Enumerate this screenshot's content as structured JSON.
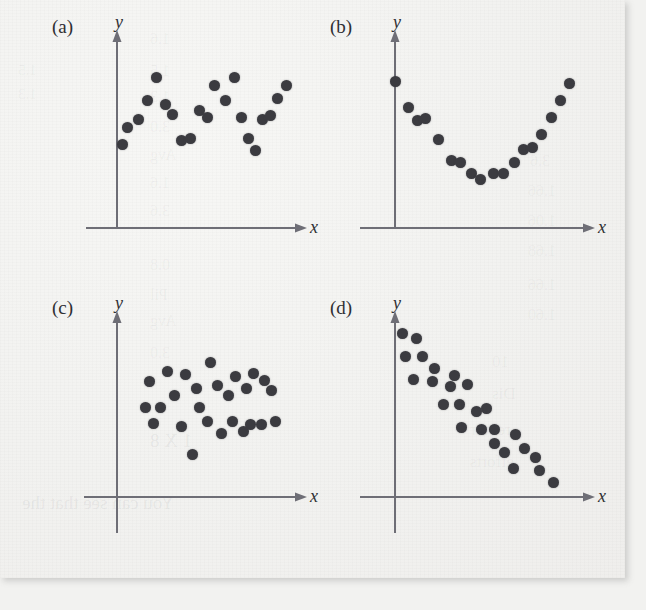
{
  "figure": {
    "background_color": "#f2f2f0",
    "dot_color": "#3b3b40",
    "axis_color": "#6e6e76",
    "panels": [
      {
        "id": "a",
        "label": "(a)",
        "xlabel": "x",
        "ylabel": "y",
        "pattern": "cyclic"
      },
      {
        "id": "b",
        "label": "(b)",
        "xlabel": "x",
        "ylabel": "y",
        "pattern": "curved-u-shape"
      },
      {
        "id": "c",
        "label": "(c)",
        "xlabel": "x",
        "ylabel": "y",
        "pattern": "random-scatter"
      },
      {
        "id": "d",
        "label": "(d)",
        "xlabel": "x",
        "ylabel": "y",
        "pattern": "decreasing-linear"
      }
    ],
    "ghost_text": [
      {
        "text": "1.5",
        "x": 18,
        "y": 62,
        "size": 15
      },
      {
        "text": "1.3",
        "x": 18,
        "y": 86,
        "size": 15
      },
      {
        "text": "1.6",
        "x": 150,
        "y": 30,
        "size": 16
      },
      {
        "text": "1.5",
        "x": 150,
        "y": 62,
        "size": 16
      },
      {
        "text": "1.3",
        "x": 150,
        "y": 88,
        "size": 16
      },
      {
        "text": "3.0",
        "x": 150,
        "y": 118,
        "size": 16
      },
      {
        "text": "Avg",
        "x": 150,
        "y": 146,
        "size": 16
      },
      {
        "text": "1.6",
        "x": 150,
        "y": 174,
        "size": 16
      },
      {
        "text": "3.6",
        "x": 150,
        "y": 202,
        "size": 16
      },
      {
        "text": "0.8",
        "x": 150,
        "y": 256,
        "size": 16
      },
      {
        "text": "Pil",
        "x": 150,
        "y": 286,
        "size": 16
      },
      {
        "text": "Avg",
        "x": 150,
        "y": 312,
        "size": 16
      },
      {
        "text": "3.0",
        "x": 150,
        "y": 344,
        "size": 16
      },
      {
        "text": "1 X 8",
        "x": 150,
        "y": 430,
        "size": 19
      },
      {
        "text": "You can see that the",
        "x": 22,
        "y": 492,
        "size": 19
      },
      {
        "text": "3.6",
        "x": 530,
        "y": 152,
        "size": 16
      },
      {
        "text": "1.66",
        "x": 528,
        "y": 182,
        "size": 16
      },
      {
        "text": "1.06",
        "x": 528,
        "y": 212,
        "size": 16
      },
      {
        "text": "1.68",
        "x": 528,
        "y": 242,
        "size": 16
      },
      {
        "text": "1.66",
        "x": 528,
        "y": 276,
        "size": 16
      },
      {
        "text": "1.60",
        "x": 528,
        "y": 306,
        "size": 16
      },
      {
        "text": "10",
        "x": 492,
        "y": 352,
        "size": 17
      },
      {
        "text": "Dis",
        "x": 492,
        "y": 384,
        "size": 17
      },
      {
        "text": "requir",
        "x": 470,
        "y": 420,
        "size": 17
      },
      {
        "text": "efforts",
        "x": 470,
        "y": 452,
        "size": 17
      }
    ]
  },
  "chart_data": [
    {
      "id": "a",
      "type": "scatter",
      "title": "(a)",
      "xlabel": "x",
      "ylabel": "y",
      "description": "Cyclic / oscillating pattern in residuals",
      "grid": false,
      "legend": false,
      "xlim": [
        0,
        100
      ],
      "ylim": [
        0,
        100
      ],
      "points": [
        [
          3,
          44
        ],
        [
          6,
          53
        ],
        [
          12,
          57
        ],
        [
          17,
          67
        ],
        [
          22,
          79
        ],
        [
          27,
          65
        ],
        [
          31,
          60
        ],
        [
          36,
          46
        ],
        [
          41,
          47
        ],
        [
          46,
          62
        ],
        [
          50,
          58
        ],
        [
          54,
          75
        ],
        [
          60,
          67
        ],
        [
          65,
          79
        ],
        [
          69,
          58
        ],
        [
          73,
          47
        ],
        [
          77,
          41
        ],
        [
          81,
          57
        ],
        [
          85,
          59
        ],
        [
          89,
          68
        ],
        [
          94,
          75
        ]
      ]
    },
    {
      "id": "b",
      "type": "scatter",
      "title": "(b)",
      "xlabel": "x",
      "ylabel": "y",
      "description": "Curved U-shaped (quadratic) pattern",
      "grid": false,
      "legend": false,
      "xlim": [
        0,
        100
      ],
      "ylim": [
        0,
        100
      ],
      "points": [
        [
          2,
          78
        ],
        [
          9,
          64
        ],
        [
          14,
          57
        ],
        [
          18,
          58
        ],
        [
          25,
          47
        ],
        [
          32,
          36
        ],
        [
          37,
          35
        ],
        [
          43,
          29
        ],
        [
          48,
          26
        ],
        [
          55,
          29
        ],
        [
          60,
          29
        ],
        [
          66,
          35
        ],
        [
          71,
          42
        ],
        [
          76,
          43
        ],
        [
          81,
          50
        ],
        [
          86,
          59
        ],
        [
          91,
          68
        ],
        [
          96,
          77
        ]
      ]
    },
    {
      "id": "c",
      "type": "scatter",
      "title": "(c)",
      "xlabel": "x",
      "ylabel": "y",
      "description": "Random scatter, no discernible pattern",
      "grid": false,
      "legend": false,
      "xlim": [
        0,
        100
      ],
      "ylim": [
        0,
        100
      ],
      "points": [
        [
          18,
          67
        ],
        [
          28,
          73
        ],
        [
          32,
          59
        ],
        [
          38,
          71
        ],
        [
          44,
          63
        ],
        [
          52,
          78
        ],
        [
          56,
          65
        ],
        [
          62,
          59
        ],
        [
          66,
          70
        ],
        [
          72,
          63
        ],
        [
          76,
          72
        ],
        [
          82,
          68
        ],
        [
          86,
          62
        ],
        [
          16,
          52
        ],
        [
          24,
          52
        ],
        [
          20,
          43
        ],
        [
          36,
          41
        ],
        [
          46,
          52
        ],
        [
          50,
          44
        ],
        [
          58,
          37
        ],
        [
          64,
          44
        ],
        [
          70,
          38
        ],
        [
          74,
          42
        ],
        [
          80,
          42
        ],
        [
          88,
          44
        ],
        [
          42,
          25
        ]
      ]
    },
    {
      "id": "d",
      "type": "scatter",
      "title": "(d)",
      "xlabel": "x",
      "ylabel": "y",
      "description": "Decreasing linear trend",
      "grid": false,
      "legend": false,
      "xlim": [
        0,
        100
      ],
      "ylim": [
        0,
        100
      ],
      "points": [
        [
          4,
          92
        ],
        [
          12,
          89
        ],
        [
          6,
          79
        ],
        [
          15,
          79
        ],
        [
          22,
          72
        ],
        [
          10,
          66
        ],
        [
          21,
          65
        ],
        [
          33,
          68
        ],
        [
          31,
          62
        ],
        [
          27,
          52
        ],
        [
          36,
          52
        ],
        [
          40,
          63
        ],
        [
          51,
          50
        ],
        [
          37,
          39
        ],
        [
          48,
          38
        ],
        [
          55,
          38
        ],
        [
          55,
          30
        ],
        [
          67,
          35
        ],
        [
          45,
          48
        ],
        [
          61,
          25
        ],
        [
          72,
          27
        ],
        [
          78,
          22
        ],
        [
          66,
          16
        ],
        [
          80,
          15
        ],
        [
          88,
          8
        ]
      ]
    }
  ]
}
